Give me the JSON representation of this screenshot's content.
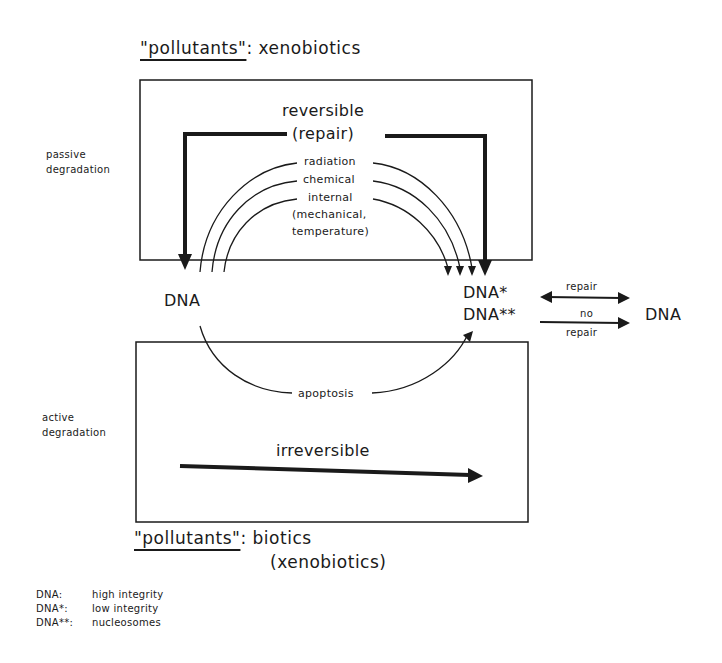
{
  "diagram": {
    "top_pollutants": {
      "label": "\"pollutants\"",
      "separator": ":",
      "value": "xenobiotics"
    },
    "bottom_pollutants": {
      "label": "\"pollutants\"",
      "separator": ":",
      "value_line1": "biotics",
      "value_line2": "(xenobiotics)"
    },
    "side_labels": {
      "passive": [
        "passive",
        "degradation"
      ],
      "active": [
        "active",
        "degradation"
      ]
    },
    "top_box": {
      "title_line1": "reversible",
      "title_line2": "(repair)",
      "causes": [
        "radiation",
        "chemical",
        "internal",
        "(mechanical,",
        "temperature)"
      ]
    },
    "bottom_box": {
      "arc_label": "apoptosis",
      "arrow_label": "irreversible"
    },
    "nodes": {
      "dna_left": "DNA",
      "dna_star": "DNA*",
      "dna_starstar": "DNA**",
      "dna_right": "DNA"
    },
    "right_arrows": {
      "repair": "repair",
      "no_repair_line1": "no",
      "no_repair_line2": "repair"
    },
    "legend": [
      {
        "key": "DNA:",
        "value": "high integrity"
      },
      {
        "key": "DNA*:",
        "value": "low integrity"
      },
      {
        "key": "DNA**:",
        "value": "nucleosomes"
      }
    ],
    "colors": {
      "ink": "#1a1a1a",
      "background": "#ffffff"
    }
  }
}
